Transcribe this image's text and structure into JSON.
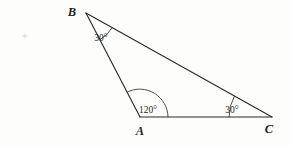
{
  "figure": {
    "kind": "geometry-diagram",
    "shape": "triangle",
    "background_color": "#fdfdfc",
    "stroke_color": "#2b2b2b",
    "arc_color": "#3a3a3a",
    "label_color": "#1f1f1f",
    "registration_mark_color": "#c9c9cf"
  },
  "vertices": [
    {
      "name": "B",
      "label": "B",
      "x": 86,
      "y": 13,
      "label_x": 72,
      "label_y": 16
    },
    {
      "name": "A",
      "label": "A",
      "x": 140,
      "y": 117,
      "label_x": 140,
      "label_y": 135
    },
    {
      "name": "C",
      "label": "C",
      "x": 272,
      "y": 117,
      "label_x": 269,
      "label_y": 133
    }
  ],
  "sides": [
    {
      "name": "side-BA",
      "from": "B",
      "to": "A"
    },
    {
      "name": "side-AC",
      "from": "A",
      "to": "C"
    },
    {
      "name": "side-BC",
      "from": "B",
      "to": "C"
    }
  ],
  "angles": [
    {
      "at": "B",
      "value": 30,
      "label": "30°",
      "label_x": 101,
      "label_y": 41,
      "arc_radius": 30,
      "arc_path": "M 110.4 41.5 A 30 30 0 0 1 100.3 42.9"
    },
    {
      "at": "A",
      "value": 120,
      "label": "120°",
      "label_x": 148,
      "label_y": 113,
      "arc_radius": 28,
      "arc_path": "M 168 117 A 28 28 0 0 0 125.5 93.1"
    },
    {
      "at": "C",
      "value": 30,
      "label": "30°",
      "label_x": 232,
      "label_y": 113,
      "arc_radius": 43,
      "arc_path": "M 229 117 A 43 43 0 0 1 234.8 94.7"
    }
  ],
  "registration_mark": {
    "name": "registration-mark",
    "x": 25,
    "y": 36,
    "size": 5
  }
}
